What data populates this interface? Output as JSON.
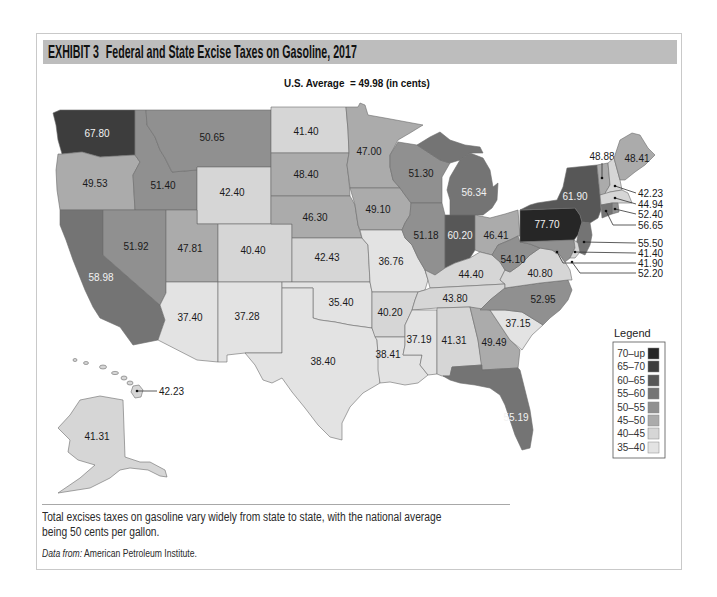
{
  "exhibit": {
    "number": "EXHIBIT 3",
    "title": "Federal and State Excise Taxes on Gasoline, 2017"
  },
  "subtitle": "U.S. Average  = 49.98 (in cents)",
  "us_average_cents": 49.98,
  "colors": {
    "header_bar": "#bdbdbd",
    "card_border": "#c9c9c9"
  },
  "legend": {
    "title": "Legend",
    "items": [
      {
        "label": "70–up",
        "color": "#262626"
      },
      {
        "label": "65–70",
        "color": "#3d3d3d"
      },
      {
        "label": "60–65",
        "color": "#575757"
      },
      {
        "label": "55–60",
        "color": "#747474"
      },
      {
        "label": "50–55",
        "color": "#909090"
      },
      {
        "label": "45–50",
        "color": "#ababab"
      },
      {
        "label": "40–45",
        "color": "#d6d6d6"
      },
      {
        "label": "35–40",
        "color": "#e3e3e3"
      }
    ]
  },
  "map": {
    "unit": "cents per gallon",
    "states": [
      {
        "code": "WA",
        "value": "67.80",
        "range": "65–70"
      },
      {
        "code": "OR",
        "value": "49.53",
        "range": "45–50"
      },
      {
        "code": "CA",
        "value": "58.98",
        "range": "55–60"
      },
      {
        "code": "ID",
        "value": "51.40",
        "range": "50–55"
      },
      {
        "code": "NV",
        "value": "51.92",
        "range": "50–55"
      },
      {
        "code": "MT",
        "value": "50.65",
        "range": "50–55"
      },
      {
        "code": "WY",
        "value": "42.40",
        "range": "40–45"
      },
      {
        "code": "UT",
        "value": "47.81",
        "range": "45–50"
      },
      {
        "code": "AZ",
        "value": "37.40",
        "range": "35–40"
      },
      {
        "code": "CO",
        "value": "40.40",
        "range": "40–45"
      },
      {
        "code": "NM",
        "value": "37.28",
        "range": "35–40"
      },
      {
        "code": "ND",
        "value": "41.40",
        "range": "40–45"
      },
      {
        "code": "SD",
        "value": "48.40",
        "range": "45–50"
      },
      {
        "code": "NE",
        "value": "46.30",
        "range": "45–50"
      },
      {
        "code": "KS",
        "value": "42.43",
        "range": "40–45"
      },
      {
        "code": "OK",
        "value": "35.40",
        "range": "35–40"
      },
      {
        "code": "TX",
        "value": "38.40",
        "range": "35–40"
      },
      {
        "code": "MN",
        "value": "47.00",
        "range": "45–50"
      },
      {
        "code": "IA",
        "value": "49.10",
        "range": "45–50"
      },
      {
        "code": "MO",
        "value": "36.76",
        "range": "35–40"
      },
      {
        "code": "AR",
        "value": "40.20",
        "range": "40–45"
      },
      {
        "code": "LA",
        "value": "38.41",
        "range": "35–40"
      },
      {
        "code": "WI",
        "value": "51.30",
        "range": "50–55"
      },
      {
        "code": "IL",
        "value": "51.18",
        "range": "50–55"
      },
      {
        "code": "MI",
        "value": "56.34",
        "range": "55–60"
      },
      {
        "code": "IN",
        "value": "60.20",
        "range": "60–65"
      },
      {
        "code": "OH",
        "value": "46.41",
        "range": "45–50"
      },
      {
        "code": "KY",
        "value": "44.40",
        "range": "40–45"
      },
      {
        "code": "TN",
        "value": "43.80",
        "range": "40–45"
      },
      {
        "code": "MS",
        "value": "37.19",
        "range": "35–40"
      },
      {
        "code": "AL",
        "value": "41.31",
        "range": "40–45"
      },
      {
        "code": "GA",
        "value": "49.49",
        "range": "45–50"
      },
      {
        "code": "FL",
        "value": "55.19",
        "range": "55–60"
      },
      {
        "code": "SC",
        "value": "37.15",
        "range": "35–40"
      },
      {
        "code": "NC",
        "value": "52.95",
        "range": "50–55"
      },
      {
        "code": "VA",
        "value": "40.80",
        "range": "40–45"
      },
      {
        "code": "WV",
        "value": "54.10",
        "range": "50–55"
      },
      {
        "code": "PA",
        "value": "77.70",
        "range": "70–up"
      },
      {
        "code": "NY",
        "value": "61.90",
        "range": "60–65"
      },
      {
        "code": "VT",
        "value": "48.88",
        "range": "45–50"
      },
      {
        "code": "NH",
        "value": "42.23",
        "range": "40–45"
      },
      {
        "code": "ME",
        "value": "48.41",
        "range": "45–50"
      },
      {
        "code": "MA",
        "value": "44.94",
        "range": "40–45"
      },
      {
        "code": "RI",
        "value": "52.40",
        "range": "50–55"
      },
      {
        "code": "CT",
        "value": "56.65",
        "range": "55–60"
      },
      {
        "code": "NJ",
        "value": "55.50",
        "range": "55–60"
      },
      {
        "code": "DE",
        "value": "41.40",
        "range": "40–45"
      },
      {
        "code": "DC",
        "value": "41.90",
        "range": "40–45"
      },
      {
        "code": "MD",
        "value": "52.20",
        "range": "50–55"
      },
      {
        "code": "AK",
        "value": "41.31",
        "range": "40–45"
      },
      {
        "code": "HI",
        "value": "42.23",
        "range": "40–45"
      }
    ]
  },
  "caption": {
    "line1": "Total excises taxes on gasoline vary widely from state to state, with the national average",
    "line2": "being 50 cents per gallon."
  },
  "source": {
    "prefix": "Data from:",
    "text": " American Petroleum Institute."
  }
}
